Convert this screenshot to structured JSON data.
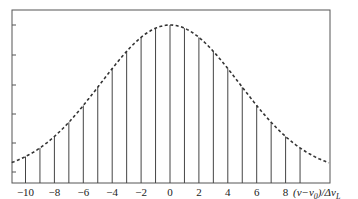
{
  "chart_data": {
    "type": "line",
    "title": "",
    "xlabel": "(ν−ν0)/ΔνL",
    "ylabel": "",
    "xlim": [
      -11,
      11
    ],
    "ylim": [
      0,
      1
    ],
    "x_ticks": [
      -10,
      -8,
      -6,
      -4,
      -2,
      0,
      2,
      4,
      6,
      8
    ],
    "x_tick_labels": [
      "−10",
      "−8",
      "−6",
      "−4",
      "−2",
      "0",
      "2",
      "4",
      "6",
      "8"
    ],
    "y_tick_count": 5,
    "grid": false,
    "legend": null,
    "series": [
      {
        "name": "envelope",
        "style": "dashed",
        "shape": "gaussian",
        "center": 0,
        "sigma": 4.8,
        "x": [
          -11,
          -10,
          -9,
          -8,
          -7,
          -6,
          -5,
          -4,
          -3,
          -2,
          -1,
          0,
          1,
          2,
          3,
          4,
          5,
          6,
          7,
          8,
          9,
          10,
          11
        ],
        "values": [
          0.07,
          0.14,
          0.18,
          0.26,
          0.35,
          0.46,
          0.58,
          0.7,
          0.82,
          0.92,
          0.98,
          1.0,
          0.98,
          0.92,
          0.82,
          0.7,
          0.58,
          0.46,
          0.35,
          0.26,
          0.18,
          0.12,
          0.08
        ]
      },
      {
        "name": "modes",
        "style": "stem",
        "x": [
          -10,
          -9,
          -8,
          -7,
          -6,
          -5,
          -4,
          -3,
          -2,
          -1,
          0,
          1,
          2,
          3,
          4,
          5,
          6,
          7,
          8,
          9
        ],
        "values": [
          0.14,
          0.18,
          0.26,
          0.35,
          0.46,
          0.58,
          0.7,
          0.82,
          0.92,
          0.98,
          1.0,
          0.98,
          0.92,
          0.82,
          0.7,
          0.58,
          0.46,
          0.35,
          0.26,
          0.18
        ]
      }
    ]
  },
  "labels": {
    "xlabel_prefix": "(ν−ν",
    "xlabel_sub0": "0",
    "xlabel_mid": ")/Δν",
    "xlabel_subL": "L"
  }
}
